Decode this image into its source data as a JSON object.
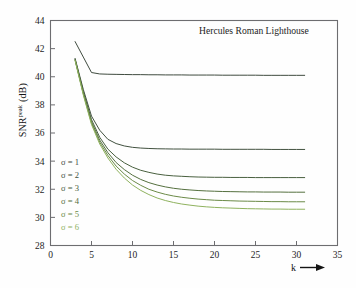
{
  "chart_data": {
    "type": "line",
    "title": "Hercules Roman Lighthouse",
    "xlabel": "k",
    "ylabel": "SNR",
    "ylabel_sup": "peak",
    "ylabel_unit": "(dB)",
    "xlim": [
      0,
      35
    ],
    "ylim": [
      28,
      44
    ],
    "xticks": [
      0,
      5,
      10,
      15,
      20,
      25,
      30,
      35
    ],
    "yticks": [
      28,
      30,
      32,
      34,
      36,
      38,
      40,
      42,
      44
    ],
    "grid": false,
    "legend_position": "inside-left",
    "x": [
      3,
      4,
      5,
      6,
      7,
      8,
      9,
      10,
      11,
      12,
      13,
      14,
      15,
      16,
      17,
      18,
      19,
      20,
      21,
      22,
      23,
      24,
      25,
      26,
      27,
      28,
      29,
      30,
      31
    ],
    "series": [
      {
        "name": "σ = 1",
        "color": "#3f4b3f",
        "values": [
          42.5,
          41.4,
          40.3,
          40.2,
          40.18,
          40.17,
          40.16,
          40.15,
          40.15,
          40.14,
          40.14,
          40.13,
          40.13,
          40.13,
          40.12,
          40.12,
          40.12,
          40.12,
          40.11,
          40.11,
          40.11,
          40.11,
          40.11,
          40.1,
          40.1,
          40.1,
          40.1,
          40.1,
          40.1
        ]
      },
      {
        "name": "σ = 2",
        "color": "#41513f",
        "values": [
          41.3,
          39.1,
          37.2,
          36.2,
          35.55,
          35.25,
          35.08,
          34.98,
          34.93,
          34.9,
          34.88,
          34.87,
          34.86,
          34.86,
          34.85,
          34.85,
          34.85,
          34.85,
          34.84,
          34.84,
          34.84,
          34.84,
          34.84,
          34.84,
          34.83,
          34.83,
          34.83,
          34.83,
          34.83
        ]
      },
      {
        "name": "σ = 3",
        "color": "#49603f",
        "values": [
          41.25,
          38.95,
          36.95,
          35.7,
          34.85,
          34.3,
          33.88,
          33.57,
          33.35,
          33.2,
          33.08,
          33.0,
          32.95,
          32.92,
          32.89,
          32.87,
          32.86,
          32.85,
          32.85,
          32.84,
          32.84,
          32.84,
          32.83,
          32.83,
          32.83,
          32.83,
          32.83,
          32.83,
          32.83
        ]
      },
      {
        "name": "σ = 4",
        "color": "#55703f",
        "values": [
          41.2,
          38.85,
          36.8,
          35.5,
          34.6,
          33.9,
          33.4,
          33.0,
          32.7,
          32.47,
          32.3,
          32.17,
          32.07,
          32.0,
          31.95,
          31.91,
          31.88,
          31.86,
          31.84,
          31.83,
          31.82,
          31.81,
          31.81,
          31.8,
          31.8,
          31.8,
          31.79,
          31.79,
          31.79
        ]
      },
      {
        "name": "σ = 5",
        "color": "#6b8a47",
        "values": [
          41.18,
          38.78,
          36.7,
          35.35,
          34.4,
          33.65,
          33.08,
          32.62,
          32.28,
          32.0,
          31.8,
          31.64,
          31.52,
          31.43,
          31.36,
          31.3,
          31.26,
          31.22,
          31.2,
          31.18,
          31.16,
          31.15,
          31.14,
          31.13,
          31.12,
          31.12,
          31.11,
          31.11,
          31.11
        ]
      },
      {
        "name": "σ = 6",
        "color": "#8fb25e",
        "values": [
          41.15,
          38.7,
          36.6,
          35.22,
          34.22,
          33.42,
          32.8,
          32.3,
          31.92,
          31.62,
          31.38,
          31.2,
          31.06,
          30.95,
          30.87,
          30.8,
          30.75,
          30.71,
          30.68,
          30.66,
          30.64,
          30.62,
          30.61,
          30.6,
          30.59,
          30.59,
          30.58,
          30.58,
          30.58
        ]
      }
    ]
  }
}
